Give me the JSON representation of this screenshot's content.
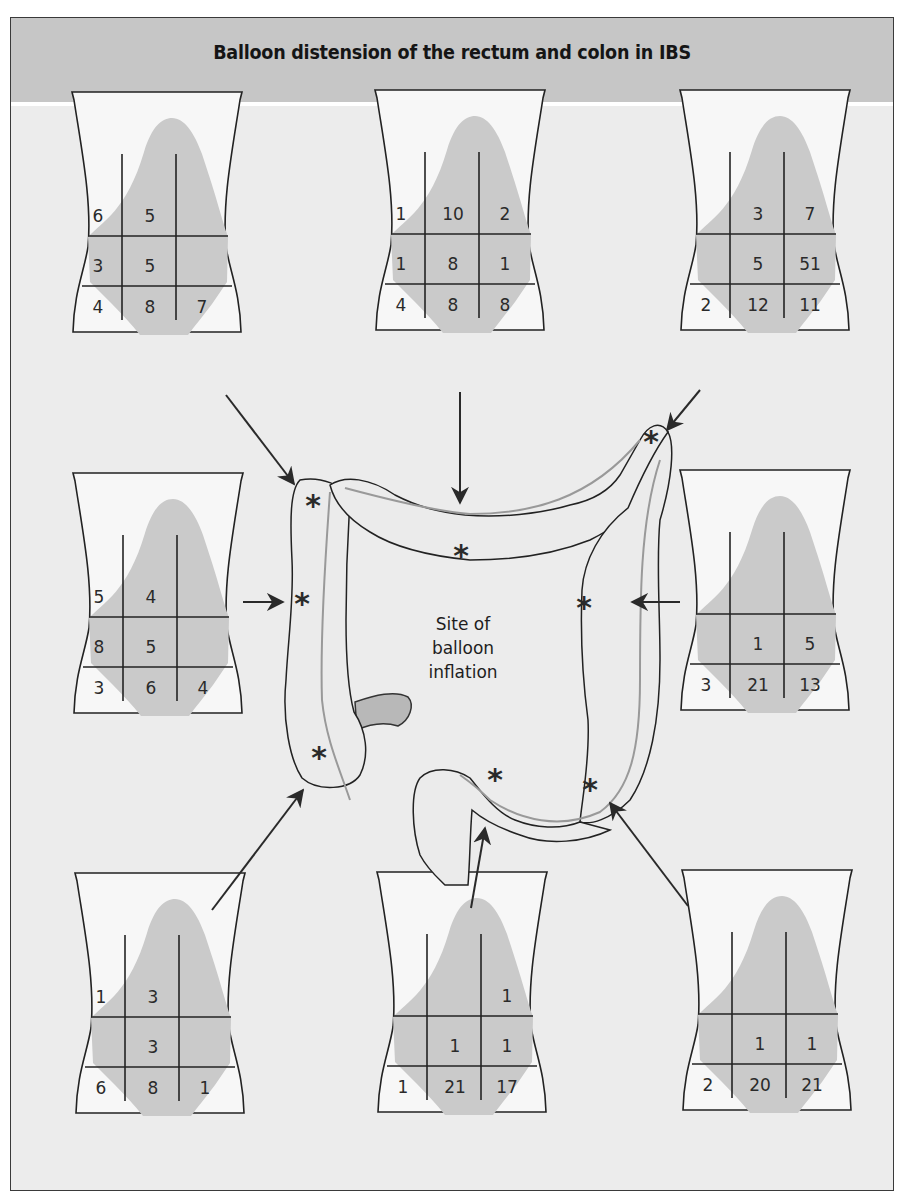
{
  "header": {
    "title": "Balloon distension of the rectum and colon in IBS"
  },
  "center_label": {
    "line1": "Site of",
    "line2": "balloon",
    "line3": "inflation"
  },
  "marker_symbol": "*",
  "colors": {
    "header_bg": "#c6c6c6",
    "panel_bg": "#ececec",
    "region_shade": "#cacaca",
    "outline": "#222222"
  },
  "panels": [
    {
      "id": "top-left",
      "site": "hepatic flexure",
      "grid": [
        [
          "6",
          "5",
          ""
        ],
        [
          "3",
          "5",
          ""
        ],
        [
          "4",
          "8",
          "7"
        ]
      ]
    },
    {
      "id": "top-center",
      "site": "transverse colon",
      "grid": [
        [
          "1",
          "10",
          "2"
        ],
        [
          "1",
          "8",
          "1"
        ],
        [
          "4",
          "8",
          "8"
        ]
      ]
    },
    {
      "id": "top-right",
      "site": "splenic flexure",
      "grid": [
        [
          "",
          "3",
          "7"
        ],
        [
          "",
          "5",
          "51"
        ],
        [
          "2",
          "12",
          "11"
        ]
      ]
    },
    {
      "id": "middle-left",
      "site": "ascending colon",
      "grid": [
        [
          "5",
          "4",
          ""
        ],
        [
          "8",
          "5",
          ""
        ],
        [
          "3",
          "6",
          "4"
        ]
      ]
    },
    {
      "id": "middle-right",
      "site": "descending colon",
      "grid": [
        [
          "",
          "",
          ""
        ],
        [
          "",
          "1",
          "5"
        ],
        [
          "3",
          "21",
          "13"
        ]
      ]
    },
    {
      "id": "bottom-left",
      "site": "caecum",
      "grid": [
        [
          "1",
          "3",
          ""
        ],
        [
          "",
          "3",
          ""
        ],
        [
          "6",
          "8",
          "1"
        ]
      ]
    },
    {
      "id": "bottom-center",
      "site": "sigmoid colon / rectum",
      "grid": [
        [
          "",
          "",
          "1"
        ],
        [
          "",
          "1",
          "1"
        ],
        [
          "1",
          "21",
          "17"
        ]
      ]
    },
    {
      "id": "bottom-right",
      "site": "sigmoid-descending junction",
      "grid": [
        [
          "",
          "",
          ""
        ],
        [
          "",
          "1",
          "1"
        ],
        [
          "2",
          "20",
          "21"
        ]
      ]
    }
  ]
}
